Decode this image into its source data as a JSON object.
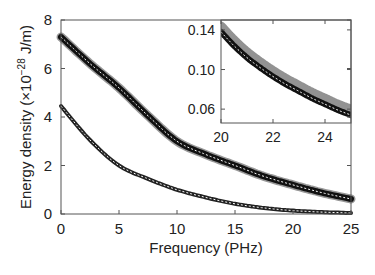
{
  "chart_data": [
    {
      "type": "line",
      "title": "",
      "xlabel": "Frequency (PHz)",
      "ylabel": "Energy density (×10^-28 J/m)",
      "ylabel_parts": {
        "main": "Energy density (×10",
        "exp": "−28",
        "unit": " J/m)"
      },
      "xlim": [
        0,
        25
      ],
      "ylim": [
        0,
        8
      ],
      "xticks": [
        0,
        5,
        10,
        15,
        20,
        25
      ],
      "yticks": [
        0,
        2,
        4,
        6,
        8
      ],
      "grid": false,
      "legend": null,
      "x": [
        0,
        2.5,
        5,
        7.5,
        10,
        12.5,
        15,
        17.5,
        20,
        22.5,
        25
      ],
      "series": [
        {
          "name": "upper",
          "style": "thick markers with white dashed fit line",
          "values": [
            7.3,
            6.2,
            5.2,
            4.05,
            3.0,
            2.45,
            2.0,
            1.55,
            1.2,
            0.88,
            0.62
          ]
        },
        {
          "name": "lower",
          "style": "small markers with white dashed fit line",
          "values": [
            4.45,
            3.05,
            2.0,
            1.45,
            1.0,
            0.68,
            0.42,
            0.25,
            0.14,
            0.08,
            0.04
          ]
        }
      ]
    },
    {
      "type": "line",
      "title": "inset",
      "xlabel": "",
      "ylabel": "",
      "xlim": [
        20,
        25
      ],
      "ylim": [
        0.046,
        0.15
      ],
      "xticks": [
        20,
        22,
        24
      ],
      "yticks": [
        0.06,
        0.1,
        0.14
      ],
      "ytick_labels": [
        "0.06",
        "0.10",
        "0.14"
      ],
      "grid": false,
      "x": [
        20,
        20.5,
        21,
        21.5,
        22,
        22.5,
        23,
        23.5,
        24,
        24.5,
        25
      ],
      "series": [
        {
          "name": "upper (zoomed)",
          "values": [
            0.138,
            0.124,
            0.112,
            0.102,
            0.093,
            0.085,
            0.078,
            0.071,
            0.065,
            0.059,
            0.054
          ]
        }
      ]
    }
  ]
}
